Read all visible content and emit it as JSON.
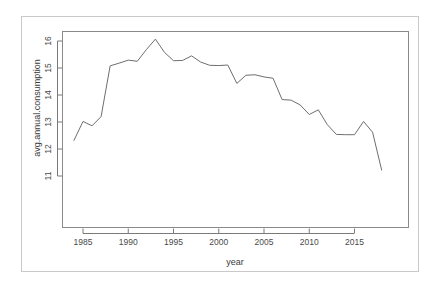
{
  "chart_data": {
    "type": "line",
    "title": "",
    "xlabel": "year",
    "ylabel": "avg.annual.consumption",
    "xlim": [
      1983.2,
      2018.6
    ],
    "ylim": [
      10.9,
      16.35
    ],
    "grid": false,
    "legend": "none",
    "xticks": [
      1985,
      1990,
      1995,
      2000,
      2005,
      2010,
      2015
    ],
    "yticks": [
      11,
      12,
      13,
      14,
      15,
      16
    ],
    "xticklabels": [
      "1985",
      "1990",
      "1995",
      "2000",
      "2005",
      "2010",
      "2015"
    ],
    "yticklabels": [
      "11",
      "12",
      "13",
      "14",
      "15",
      "16"
    ],
    "line_color": "#6e6e6e",
    "x": [
      1984,
      1985,
      1986,
      1987,
      1988,
      1989,
      1990,
      1991,
      1992,
      1993,
      1994,
      1995,
      1996,
      1997,
      1998,
      1999,
      2000,
      2001,
      2002,
      2003,
      2004,
      2005,
      2006,
      2007,
      2008,
      2009,
      2010,
      2011,
      2012,
      2013,
      2014,
      2015,
      2016,
      2017,
      2018
    ],
    "values": [
      12.32,
      13.02,
      12.86,
      13.2,
      15.08,
      15.18,
      15.29,
      15.25,
      15.68,
      16.07,
      15.58,
      15.27,
      15.28,
      15.45,
      15.22,
      15.1,
      15.09,
      15.11,
      14.43,
      14.73,
      14.75,
      14.67,
      14.62,
      13.83,
      13.81,
      13.63,
      13.28,
      13.45,
      12.9,
      12.54,
      12.53,
      12.53,
      13.02,
      12.62,
      11.22
    ],
    "series": [
      {
        "name": "avg.annual.consumption",
        "values": [
          12.32,
          13.02,
          12.86,
          13.2,
          15.08,
          15.18,
          15.29,
          15.25,
          15.68,
          16.07,
          15.58,
          15.27,
          15.28,
          15.45,
          15.22,
          15.1,
          15.09,
          15.11,
          14.43,
          14.73,
          14.75,
          14.67,
          14.62,
          13.83,
          13.81,
          13.63,
          13.28,
          13.45,
          12.9,
          12.54,
          12.53,
          12.53,
          13.02,
          12.62,
          11.22
        ]
      }
    ]
  }
}
